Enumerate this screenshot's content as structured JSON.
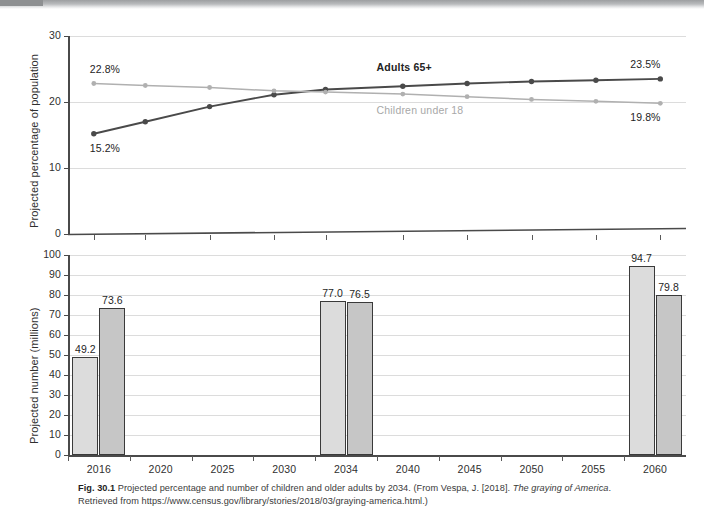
{
  "figure": {
    "number": "Fig. 30.1",
    "caption_part1": "Projected percentage and number of children and older adults by 2034. (From Vespa, J. [2018].",
    "caption_italic1": "The graying of America",
    "caption_part2": ". Retrieved from https://www.census.gov/library/stories/2018/03/graying-america.html.)"
  },
  "colors": {
    "adults_line": "#4a4a4a",
    "children_line": "#b0b0b0",
    "bar_older": "#dcdcdc",
    "bar_children": "#c6c6c6",
    "bar_outline": "#3a3a3a",
    "grid": "#dcdcdc",
    "axis": "#4a4a4a"
  },
  "chart_data": [
    {
      "type": "line",
      "id": "percentage-panel",
      "title": "",
      "xlabel": "",
      "ylabel": "Projected percentage of population",
      "ylim": [
        0,
        30
      ],
      "yticks": [
        0,
        10,
        20,
        30
      ],
      "ytick_labels": [
        "0",
        "10",
        "20",
        "30"
      ],
      "grid": true,
      "x": [
        2016,
        2020,
        2025,
        2030,
        2034,
        2040,
        2045,
        2050,
        2055,
        2060
      ],
      "xlim": [
        2014,
        2062
      ],
      "xtick_labels": [],
      "legend_position": "inline-annotations",
      "series": [
        {
          "name": "Adults 65+",
          "color": "#4a4a4a",
          "label_x": 2042,
          "label_y": 25.2,
          "values": [
            15.2,
            17.0,
            19.3,
            21.1,
            21.9,
            22.4,
            22.8,
            23.1,
            23.3,
            23.5
          ],
          "endpoint_labels": [
            {
              "index": 0,
              "text": "15.2%"
            },
            {
              "index": 9,
              "text": "23.5%"
            }
          ]
        },
        {
          "name": "Children under 18",
          "color": "#b0b0b0",
          "label_x": 2042,
          "label_y": 18.6,
          "values": [
            22.8,
            22.5,
            22.2,
            21.7,
            21.5,
            21.2,
            20.8,
            20.4,
            20.1,
            19.8
          ],
          "endpoint_labels": [
            {
              "index": 0,
              "text": "22.8%"
            },
            {
              "index": 9,
              "text": "19.8%"
            }
          ]
        }
      ]
    },
    {
      "type": "bar",
      "id": "number-panel",
      "title": "",
      "xlabel": "",
      "ylabel": "Projected number (millions)",
      "ylim": [
        0,
        100
      ],
      "yticks": [
        0,
        10,
        20,
        30,
        40,
        50,
        60,
        70,
        80,
        90,
        100
      ],
      "ytick_labels": [
        "0",
        "10",
        "20",
        "30",
        "40",
        "50",
        "60",
        "70",
        "80",
        "90",
        "100"
      ],
      "grid": true,
      "categories": [
        "2016",
        "2020",
        "2025",
        "2030",
        "2034",
        "2040",
        "2045",
        "2050",
        "2055",
        "2060"
      ],
      "series": [
        {
          "name": "Adults 65+",
          "color": "#dcdcdc",
          "values": [
            49.2,
            null,
            null,
            null,
            77.0,
            null,
            null,
            null,
            null,
            94.7
          ],
          "value_labels": [
            "49.2",
            "",
            "",
            "",
            "77.0",
            "",
            "",
            "",
            "",
            "94.7"
          ]
        },
        {
          "name": "Children under 18",
          "color": "#c6c6c6",
          "values": [
            73.6,
            null,
            null,
            null,
            76.5,
            null,
            null,
            null,
            null,
            79.8
          ],
          "value_labels": [
            "73.6",
            "",
            "",
            "",
            "76.5",
            "",
            "",
            "",
            "",
            "79.8"
          ]
        }
      ]
    }
  ]
}
